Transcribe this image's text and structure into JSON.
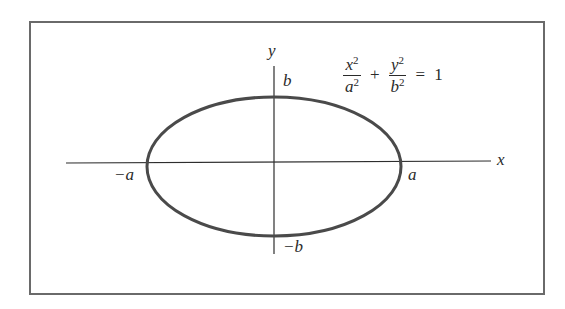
{
  "figure": {
    "type": "ellipse-diagram",
    "equation": {
      "term1": {
        "numerator_var": "x",
        "numerator_exp": "2",
        "denominator_var": "a",
        "denominator_exp": "2"
      },
      "plus": "+",
      "term2": {
        "numerator_var": "y",
        "numerator_exp": "2",
        "denominator_var": "b",
        "denominator_exp": "2"
      },
      "equals": "=",
      "rhs": "1"
    },
    "axes": {
      "x_label": "x",
      "y_label": "y"
    },
    "intercepts": {
      "pos_a": "a",
      "neg_a": "−a",
      "pos_b": "b",
      "neg_b": "−b"
    },
    "colors": {
      "ellipse": "#4a4a4a",
      "axes": "#2e2e2e",
      "frame": "#6a6a6a",
      "text": "#2a2a2a"
    }
  }
}
